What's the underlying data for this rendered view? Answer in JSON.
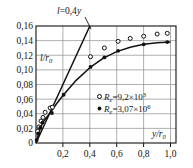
{
  "chart_data": {
    "type": "scatter",
    "title": "",
    "xlabel": "y/r0",
    "ylabel": "l/r0",
    "xlabel_display": "y/r",
    "xlabel_sub": "0",
    "ylabel_display": "l/r",
    "ylabel_sub": "0",
    "xlim": [
      0,
      1.04
    ],
    "ylim": [
      0,
      0.16
    ],
    "xticks": [
      0,
      0.2,
      0.4,
      0.6,
      0.8,
      1.0
    ],
    "xticklabels": [
      "0",
      "0,2",
      "0,4",
      "0,6",
      "0,8",
      "1,0"
    ],
    "yticks": [
      0,
      0.02,
      0.04,
      0.06,
      0.08,
      0.1,
      0.12,
      0.14,
      0.16
    ],
    "yticklabels": [
      "0",
      "0,02",
      "0,04",
      "0,06",
      "0,08",
      "0,10",
      "0,12",
      "0,14",
      "0,16"
    ],
    "grid": true,
    "grid_color": "#8c8c8c",
    "axis_color": "#111111",
    "legend_position": "center-right",
    "annotations": [
      {
        "name": "line-equation",
        "text": "l=0,4y",
        "text_italic_parts": [
          "l",
          "y"
        ],
        "x": 0.3,
        "y": 0.182,
        "leader_to_x": 0.345,
        "leader_to_y": 0.158
      }
    ],
    "series": [
      {
        "name": "Re=9,2×10³",
        "label_prefix": "R",
        "label_sub": "e",
        "label_value": "=9,2×10",
        "label_exp": "3",
        "marker": "open-circle",
        "marker_color": "#111111",
        "points": [
          {
            "x": 0.012,
            "y": 0.016
          },
          {
            "x": 0.022,
            "y": 0.022
          },
          {
            "x": 0.037,
            "y": 0.03
          },
          {
            "x": 0.052,
            "y": 0.035
          },
          {
            "x": 0.068,
            "y": 0.042
          },
          {
            "x": 0.105,
            "y": 0.048
          },
          {
            "x": 0.122,
            "y": 0.049
          },
          {
            "x": 0.405,
            "y": 0.118
          },
          {
            "x": 0.508,
            "y": 0.13
          },
          {
            "x": 0.61,
            "y": 0.139
          },
          {
            "x": 0.7,
            "y": 0.143
          },
          {
            "x": 0.8,
            "y": 0.146
          },
          {
            "x": 0.9,
            "y": 0.149
          },
          {
            "x": 0.975,
            "y": 0.15
          }
        ]
      },
      {
        "name": "Re=3,07×10⁶",
        "label_prefix": "R",
        "label_sub": "e",
        "label_value": "=3,07×10",
        "label_exp": "6",
        "marker": "filled-circle",
        "marker_color": "#111111",
        "points": [
          {
            "x": 0.005,
            "y": 0.004
          },
          {
            "x": 0.018,
            "y": 0.013
          },
          {
            "x": 0.032,
            "y": 0.021
          },
          {
            "x": 0.048,
            "y": 0.028
          },
          {
            "x": 0.118,
            "y": 0.041
          },
          {
            "x": 0.205,
            "y": 0.066
          },
          {
            "x": 0.405,
            "y": 0.104
          },
          {
            "x": 0.508,
            "y": 0.117
          },
          {
            "x": 0.61,
            "y": 0.126
          },
          {
            "x": 0.8,
            "y": 0.135
          },
          {
            "x": 0.975,
            "y": 0.138
          }
        ]
      }
    ],
    "curves": [
      {
        "name": "straight-line",
        "kind": "line",
        "equation": "l=0,4y",
        "slope": 0.4,
        "intercept": 0,
        "x_start": 0,
        "x_end": 0.4,
        "y_start": 0,
        "y_end": 0.16
      },
      {
        "name": "fitted-curve",
        "kind": "curve",
        "points": [
          {
            "x": 0.0,
            "y": 0.0
          },
          {
            "x": 0.025,
            "y": 0.016
          },
          {
            "x": 0.05,
            "y": 0.028
          },
          {
            "x": 0.1,
            "y": 0.04
          },
          {
            "x": 0.15,
            "y": 0.053
          },
          {
            "x": 0.2,
            "y": 0.065
          },
          {
            "x": 0.3,
            "y": 0.086
          },
          {
            "x": 0.4,
            "y": 0.103
          },
          {
            "x": 0.5,
            "y": 0.116
          },
          {
            "x": 0.6,
            "y": 0.125
          },
          {
            "x": 0.7,
            "y": 0.131
          },
          {
            "x": 0.8,
            "y": 0.135
          },
          {
            "x": 0.9,
            "y": 0.137
          },
          {
            "x": 1.0,
            "y": 0.138
          }
        ]
      }
    ]
  },
  "axis_labels": {
    "y_inner_label": "l/r",
    "y_inner_sub": "0",
    "x_outer_label": "y/r",
    "x_outer_sub": "0"
  },
  "annotation": {
    "equation_l": "l",
    "equation_eq": "=0,4",
    "equation_y": "y"
  },
  "legend": {
    "entries": [
      {
        "marker": "open-circle",
        "prefix": "R",
        "sub": "e",
        "mid": "=9,2×10",
        "exp": "3"
      },
      {
        "marker": "filled-circle",
        "prefix": "R",
        "sub": "e",
        "mid": "=3,07×10",
        "exp": "6"
      }
    ]
  },
  "ticks": {
    "y": [
      "0,16",
      "0,14",
      "0,12",
      "0,10",
      "0,08",
      "0,06",
      "0,04",
      "0,02",
      "0"
    ],
    "x": [
      "0,2",
      "0,4",
      "0,6",
      "0,8",
      "1,0"
    ]
  }
}
